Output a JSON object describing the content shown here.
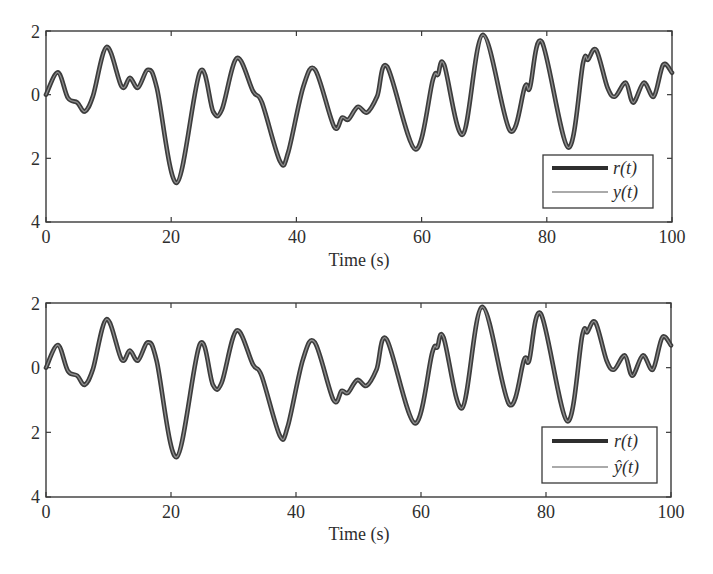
{
  "chart_data": [
    {
      "type": "line",
      "title": "",
      "xlabel": "Time (s)",
      "ylabel": "",
      "xlim": [
        0,
        100
      ],
      "ylim": [
        -4,
        2
      ],
      "xticks": [
        0,
        20,
        40,
        60,
        80,
        100
      ],
      "xtick_labels": [
        "0",
        "20",
        "40",
        "60",
        "80",
        "100"
      ],
      "yticks": [
        2,
        0,
        -2,
        -4
      ],
      "ytick_labels": [
        "2",
        "0",
        "2",
        "4"
      ],
      "grid": false,
      "legend_position": "lower right",
      "legend": [
        "r(t)",
        "y(t)"
      ],
      "series": [
        {
          "name": "r(t)",
          "style": "thick dark"
        },
        {
          "name": "y(t)",
          "style": "thin gray"
        }
      ],
      "x": [
        0,
        1.9,
        3.5,
        5,
        6.2,
        7.5,
        9.7,
        12.1,
        13.4,
        14.7,
        16.3,
        17.7,
        20.9,
        24.6,
        26.7,
        28.1,
        30.5,
        33.1,
        34.5,
        37.4,
        38.7,
        41.1,
        43,
        46,
        47.3,
        48.3,
        49.8,
        51.3,
        52.9,
        54.5,
        59,
        61.8,
        62.6,
        63.6,
        66.6,
        69.8,
        74.1,
        76.5,
        77.3,
        79.2,
        83.4,
        85.8,
        86.6,
        87.9,
        89.7,
        90.9,
        92.6,
        93.8,
        95.5,
        97.1,
        98.6,
        100
      ],
      "values": [
        0,
        0.7,
        -0.1,
        -0.25,
        -0.53,
        -0.05,
        1.5,
        0.25,
        0.53,
        0.22,
        0.78,
        0.22,
        -2.77,
        0.72,
        -0.53,
        -0.47,
        1.15,
        0.1,
        -0.25,
        -2.1,
        -1.8,
        0.25,
        0.78,
        -1.0,
        -0.72,
        -0.78,
        -0.38,
        -0.56,
        -0.05,
        0.88,
        -1.72,
        0.47,
        0.63,
        0.94,
        -1.25,
        1.88,
        -1.13,
        0.25,
        0.22,
        1.66,
        -1.66,
        1.0,
        1.1,
        1.4,
        0.22,
        -0.06,
        0.38,
        -0.25,
        0.38,
        -0.06,
        0.94,
        0.69
      ]
    },
    {
      "type": "line",
      "title": "",
      "xlabel": "Time (s)",
      "ylabel": "",
      "xlim": [
        0,
        100
      ],
      "ylim": [
        -4,
        2
      ],
      "xticks": [
        0,
        20,
        40,
        60,
        80,
        100
      ],
      "xtick_labels": [
        "0",
        "20",
        "40",
        "60",
        "80",
        "100"
      ],
      "yticks": [
        2,
        0,
        -2,
        -4
      ],
      "ytick_labels": [
        "2",
        "0",
        "2",
        "4"
      ],
      "grid": false,
      "legend_position": "lower right",
      "legend": [
        "r(t)",
        "ŷ(t)"
      ],
      "series": [
        {
          "name": "r(t)",
          "style": "thick dark"
        },
        {
          "name": "ŷ(t)",
          "style": "thin gray"
        }
      ],
      "x": [
        0,
        1.9,
        3.5,
        5,
        6.2,
        7.5,
        9.7,
        12.1,
        13.4,
        14.7,
        16.3,
        17.7,
        20.9,
        24.6,
        26.7,
        28.1,
        30.5,
        33.1,
        34.5,
        37.4,
        38.7,
        41.1,
        43,
        46,
        47.3,
        48.3,
        49.8,
        51.3,
        52.9,
        54.5,
        59,
        61.8,
        62.6,
        63.6,
        66.6,
        69.8,
        74.1,
        76.5,
        77.3,
        79.2,
        83.4,
        85.8,
        86.6,
        87.9,
        89.7,
        90.9,
        92.6,
        93.8,
        95.5,
        97.1,
        98.6,
        100
      ],
      "values": [
        0,
        0.7,
        -0.1,
        -0.25,
        -0.53,
        -0.05,
        1.5,
        0.25,
        0.53,
        0.22,
        0.78,
        0.22,
        -2.77,
        0.72,
        -0.53,
        -0.47,
        1.15,
        0.1,
        -0.25,
        -2.1,
        -1.8,
        0.25,
        0.78,
        -1.0,
        -0.72,
        -0.78,
        -0.38,
        -0.56,
        -0.05,
        0.88,
        -1.72,
        0.47,
        0.63,
        0.94,
        -1.25,
        1.88,
        -1.13,
        0.25,
        0.22,
        1.66,
        -1.66,
        1.0,
        1.1,
        1.4,
        0.22,
        -0.06,
        0.38,
        -0.25,
        0.38,
        -0.06,
        0.94,
        0.69
      ]
    }
  ],
  "panels": [
    {
      "xlabel": "Time (s)",
      "xticks": [
        "0",
        "20",
        "40",
        "60",
        "80",
        "100"
      ],
      "yticks": [
        "2",
        "0",
        "2",
        "4"
      ],
      "legend": [
        "r(t)",
        "y(t)"
      ]
    },
    {
      "xlabel": "Time (s)",
      "xticks": [
        "0",
        "20",
        "40",
        "60",
        "80",
        "100"
      ],
      "yticks": [
        "2",
        "0",
        "2",
        "4"
      ],
      "legend": [
        "r(t)",
        "ŷ(t)"
      ]
    }
  ],
  "colors": {
    "axis": "#3a3a3a",
    "reference_line": "#3c3c3c",
    "output_line": "#8e8e8e"
  }
}
